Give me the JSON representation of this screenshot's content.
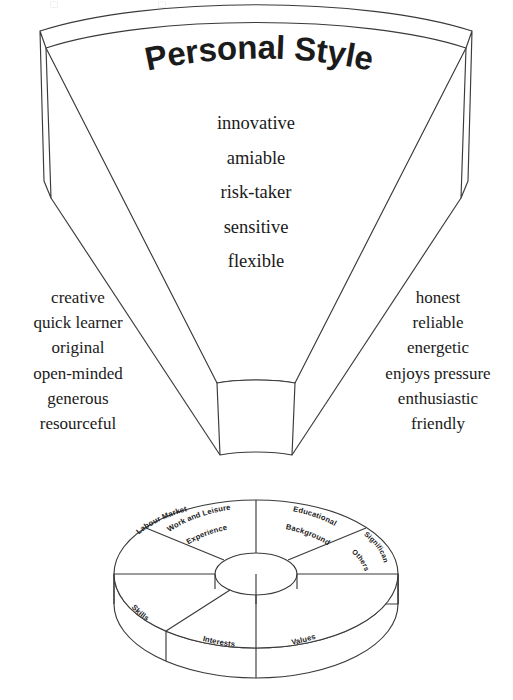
{
  "diagram": {
    "title": "Personal Style",
    "center_traits": [
      "innovative",
      "amiable",
      "risk-taker",
      "sensitive",
      "flexible"
    ],
    "left_traits": [
      "creative",
      "quick learner",
      "original",
      "open-minded",
      "generous",
      "resourceful"
    ],
    "right_traits": [
      "honest",
      "reliable",
      "energetic",
      "enjoys pressure",
      "enthusiastic",
      "friendly"
    ],
    "stroke_color": "#3a3a3a",
    "text_color": "#1a1a1a",
    "fill_color": "#ffffff"
  },
  "wheel": {
    "segments": [
      {
        "id": "work-and-leisure-experience",
        "line1": "Work and Leisure",
        "line2": "Experience"
      },
      {
        "id": "educational-background",
        "line1": "Educational",
        "line2": "Background"
      },
      {
        "id": "significant-others",
        "line1": "Significant",
        "line2": "Others"
      },
      {
        "id": "values",
        "line1": "Values",
        "line2": ""
      },
      {
        "id": "interests",
        "line1": "Interests",
        "line2": ""
      },
      {
        "id": "skills",
        "line1": "Skills",
        "line2": ""
      },
      {
        "id": "labour-market",
        "line1": "Labour Market",
        "line2": ""
      }
    ]
  }
}
